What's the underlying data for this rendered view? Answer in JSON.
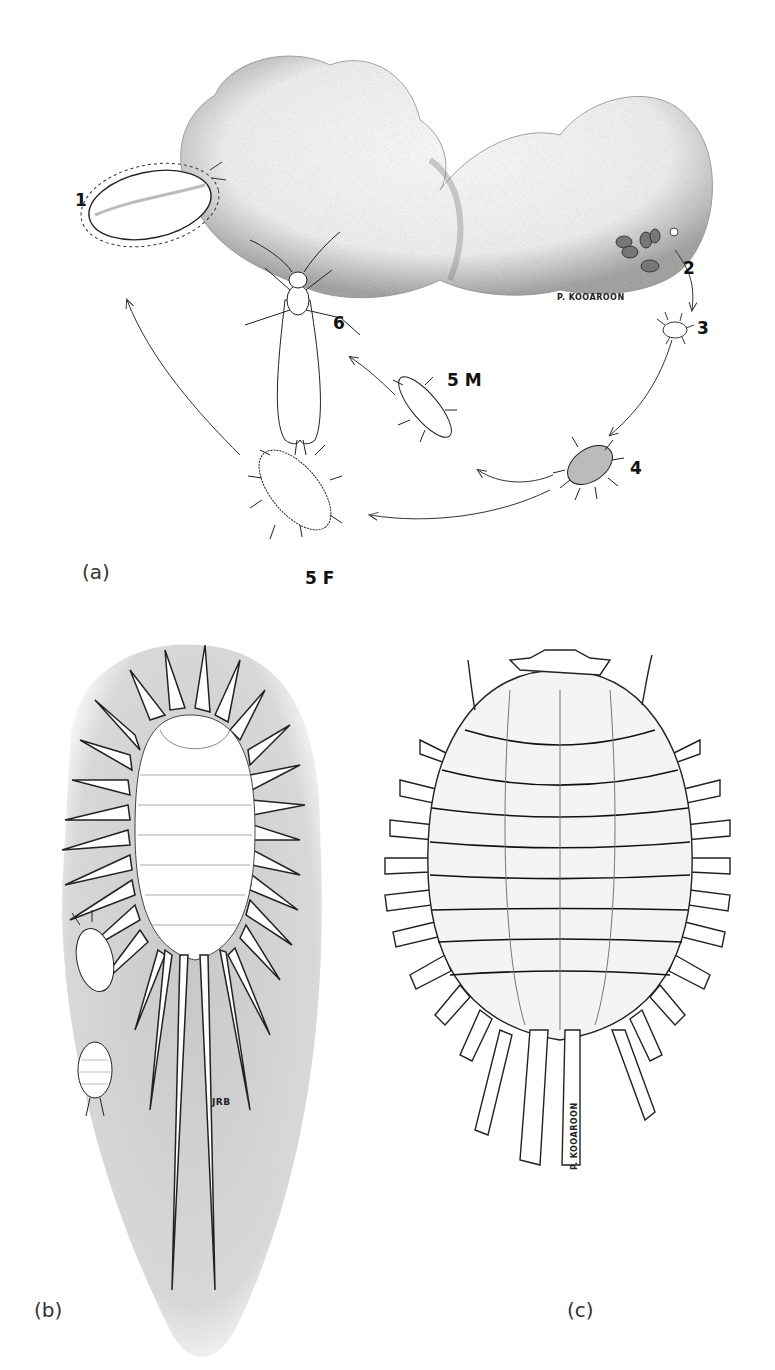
{
  "figure": {
    "panels": [
      {
        "id": "a",
        "label": "(a)",
        "description": "Life cycle diagram on a plant tuft",
        "stages": [
          {
            "id": "1",
            "label": "1"
          },
          {
            "id": "2",
            "label": "2"
          },
          {
            "id": "3",
            "label": "3"
          },
          {
            "id": "4",
            "label": "4"
          },
          {
            "id": "5M",
            "label": "5 M"
          },
          {
            "id": "5F",
            "label": "5 F"
          },
          {
            "id": "6",
            "label": "6"
          }
        ],
        "signature": "P. KOOAROON"
      },
      {
        "id": "b",
        "label": "(b)",
        "description": "Spined insect with long tail filaments and two small nymphs",
        "signature": "JRB"
      },
      {
        "id": "c",
        "label": "(c)",
        "description": "Segmented insect, dorsal view",
        "signature": "P. KOOAROON"
      }
    ]
  }
}
